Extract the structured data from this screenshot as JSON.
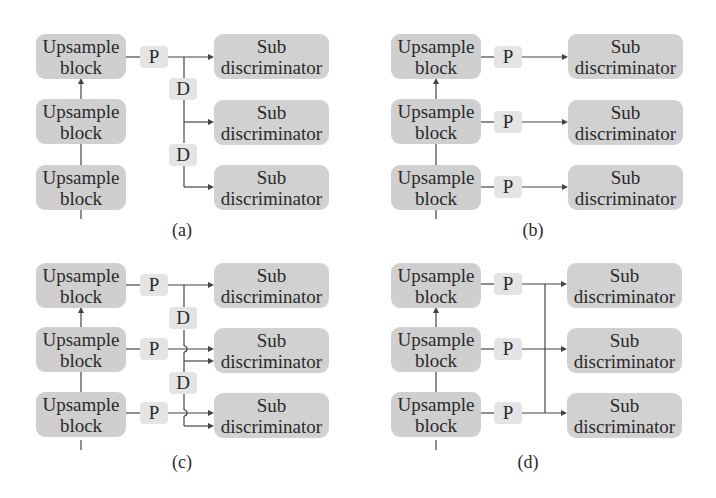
{
  "panels": {
    "a": {
      "caption": "(a)",
      "upsample": [
        "Upsample\nblock",
        "Upsample\nblock",
        "Upsample\nblock"
      ],
      "pool": [
        "P"
      ],
      "downsample": [
        "D",
        "D"
      ],
      "sub": [
        "Sub\ndiscriminator",
        "Sub\ndiscriminator",
        "Sub\ndiscriminator"
      ]
    },
    "b": {
      "caption": "(b)",
      "upsample": [
        "Upsample\nblock",
        "Upsample\nblock",
        "Upsample\nblock"
      ],
      "pool": [
        "P",
        "P",
        "P"
      ],
      "sub": [
        "Sub\ndiscriminator",
        "Sub\ndiscriminator",
        "Sub\ndiscriminator"
      ]
    },
    "c": {
      "caption": "(c)",
      "upsample": [
        "Upsample\nblock",
        "Upsample\nblock",
        "Upsample\nblock"
      ],
      "pool": [
        "P",
        "P",
        "P"
      ],
      "downsample": [
        "D",
        "D"
      ],
      "sub": [
        "Sub\ndiscriminator",
        "Sub\ndiscriminator",
        "Sub\ndiscriminator"
      ]
    },
    "d": {
      "caption": "(d)",
      "upsample": [
        "Upsample\nblock",
        "Upsample\nblock",
        "Upsample\nblock"
      ],
      "pool": [
        "P",
        "P",
        "P"
      ],
      "sub": [
        "Sub\ndiscriminator",
        "Sub\ndiscriminator",
        "Sub\ndiscriminator"
      ]
    }
  },
  "colors": {
    "block": "#cfcfcf",
    "small_block": "#e4e4e4",
    "line": "#444444"
  }
}
